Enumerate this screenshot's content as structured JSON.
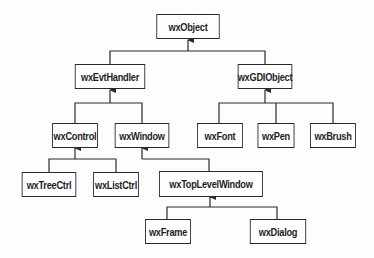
{
  "diagram": {
    "type": "class-hierarchy",
    "nodes": [
      {
        "id": "wxObject",
        "label": "wxObject",
        "x": 152,
        "y": 14,
        "w": 72,
        "h": 25
      },
      {
        "id": "wxEvtHandler",
        "label": "wxEvtHandler",
        "x": 70,
        "y": 64,
        "w": 80,
        "h": 25
      },
      {
        "id": "wxGDIObject",
        "label": "wxGDIObject",
        "x": 234,
        "y": 64,
        "w": 62,
        "h": 25
      },
      {
        "id": "wxControl",
        "label": "wxControl",
        "x": 49,
        "y": 123,
        "w": 52,
        "h": 25
      },
      {
        "id": "wxWindow",
        "label": "wxWindow",
        "x": 111,
        "y": 123,
        "w": 62,
        "h": 25
      },
      {
        "id": "wxFont",
        "label": "wxFont",
        "x": 194,
        "y": 123,
        "w": 52,
        "h": 25
      },
      {
        "id": "wxPen",
        "label": "wxPen",
        "x": 255,
        "y": 123,
        "w": 42,
        "h": 25
      },
      {
        "id": "wxBrush",
        "label": "wxBrush",
        "x": 307,
        "y": 123,
        "w": 52,
        "h": 25
      },
      {
        "id": "wxTreeCtrl",
        "label": "wxTreeCtrl",
        "x": 18,
        "y": 172,
        "w": 62,
        "h": 25
      },
      {
        "id": "wxListCtrl",
        "label": "wxListCtrl",
        "x": 90,
        "y": 172,
        "w": 52,
        "h": 25
      },
      {
        "id": "wxTopLevelWindow",
        "label": "wxTopLevelWindow",
        "x": 152,
        "y": 171,
        "w": 118,
        "h": 26
      },
      {
        "id": "wxFrame",
        "label": "wxFrame",
        "x": 142,
        "y": 219,
        "w": 52,
        "h": 25
      },
      {
        "id": "wxDialog",
        "label": "wxDialog",
        "x": 246,
        "y": 219,
        "w": 64,
        "h": 25
      }
    ],
    "edges": [
      {
        "child": "wxEvtHandler",
        "parent": "wxObject"
      },
      {
        "child": "wxGDIObject",
        "parent": "wxObject"
      },
      {
        "child": "wxControl",
        "parent": "wxEvtHandler"
      },
      {
        "child": "wxWindow",
        "parent": "wxEvtHandler"
      },
      {
        "child": "wxFont",
        "parent": "wxGDIObject"
      },
      {
        "child": "wxPen",
        "parent": "wxGDIObject"
      },
      {
        "child": "wxBrush",
        "parent": "wxGDIObject"
      },
      {
        "child": "wxTreeCtrl",
        "parent": "wxControl"
      },
      {
        "child": "wxListCtrl",
        "parent": "wxControl"
      },
      {
        "child": "wxTopLevelWindow",
        "parent": "wxWindow"
      },
      {
        "child": "wxFrame",
        "parent": "wxTopLevelWindow"
      },
      {
        "child": "wxDialog",
        "parent": "wxTopLevelWindow"
      }
    ],
    "colors": {
      "line": "#2a2a2a",
      "box_border": "#2a2a2a",
      "text": "#1e1e1e",
      "background": "#fdfdfd"
    }
  }
}
